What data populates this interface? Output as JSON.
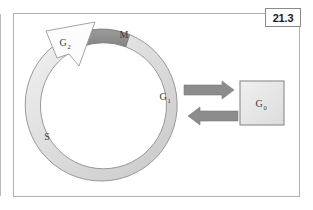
{
  "figure": {
    "number_label": "21.3",
    "frame": {
      "border_color": "#b0b0b0",
      "background": "#ffffff"
    }
  },
  "diagram": {
    "type": "cell-cycle-ring",
    "ring": {
      "name": "cell-cycle-ring",
      "fill_light": "#e8e8e8",
      "fill_mid": "#cfcfcf",
      "stroke": "#8c8c8c",
      "center_x": 106,
      "center_y": 107,
      "outer_radius": 76,
      "inner_radius": 63
    },
    "phases": [
      {
        "id": "M",
        "label": "M",
        "sublabel": "",
        "description": "mitosis phase segment at top of ring",
        "fill": "#909090",
        "label_x": 124,
        "label_y": 38
      },
      {
        "id": "G1",
        "label": "G",
        "sublabel": "1",
        "description": "gap 1 phase on right of ring",
        "fill": "#d6d6d6",
        "label_x": 166,
        "label_y": 100
      },
      {
        "id": "S",
        "label": "S",
        "sublabel": "",
        "description": "synthesis phase on left of ring",
        "fill": "#dcdcdc",
        "label_x": 47,
        "label_y": 140
      },
      {
        "id": "G2",
        "label": "G",
        "sublabel": "2",
        "description": "gap 2 phase arrowhead at upper left",
        "fill": "#fbfbfb",
        "label_x": 64,
        "label_y": 45
      }
    ],
    "quiescent_box": {
      "name": "g0-box",
      "label": "G",
      "sublabel": "0",
      "fill": "#e7e7e7",
      "stroke": "#8a8a8a",
      "x": 240,
      "y": 81,
      "width": 44,
      "height": 44
    },
    "arrows": [
      {
        "id": "enter-g0",
        "direction": "right",
        "description": "arrow from G1 into G0",
        "color": "#8a8a8a"
      },
      {
        "id": "exit-g0",
        "direction": "left",
        "description": "arrow from G0 back into G1",
        "color": "#8a8a8a"
      },
      {
        "id": "cycle-direction",
        "direction": "counterclockwise-head-upper-left",
        "description": "white arrowhead marking G2 and cycle direction",
        "color": "#fbfbfb"
      }
    ]
  }
}
